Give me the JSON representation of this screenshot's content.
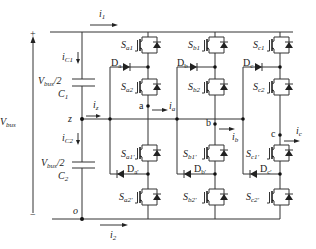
{
  "diagram": {
    "type": "three-level NPC-type inverter schematic",
    "stroke_color": "#333333",
    "source": {
      "label": "V",
      "label_sub": "bus",
      "plus_sign": "+",
      "minus_sign": "−"
    },
    "capacitors": [
      {
        "id": "C1",
        "name": "C",
        "name_sub": "1",
        "voltage": "V",
        "voltage_sub": "bus",
        "voltage_suffix": "/2",
        "current": "i",
        "current_sub": "C1"
      },
      {
        "id": "C2",
        "name": "C",
        "name_sub": "2",
        "voltage": "V",
        "voltage_sub": "bus",
        "voltage_suffix": "/2",
        "current": "i",
        "current_sub": "C2"
      }
    ],
    "nodes": {
      "z": "z",
      "o": "o",
      "a": "a",
      "b": "b",
      "c": "c"
    },
    "currents": {
      "i1": {
        "sym": "i",
        "sub": "1"
      },
      "iz": {
        "sym": "i",
        "sub": "z"
      },
      "i2": {
        "sym": "i",
        "sub": "2"
      },
      "ia": {
        "sym": "i",
        "sub": "a"
      },
      "ib": {
        "sym": "i",
        "sub": "b"
      },
      "ic": {
        "sym": "i",
        "sub": "c"
      }
    },
    "switches": {
      "upper": [
        {
          "phase": "a",
          "s1": {
            "sym": "S",
            "sub": "a1"
          },
          "s2": {
            "sym": "S",
            "sub": "a2"
          },
          "diode": {
            "sym": "D",
            "sub": "a"
          }
        },
        {
          "phase": "b",
          "s1": {
            "sym": "S",
            "sub": "b1"
          },
          "s2": {
            "sym": "S",
            "sub": "b2"
          },
          "diode": {
            "sym": "D",
            "sub": "b"
          }
        },
        {
          "phase": "c",
          "s1": {
            "sym": "S",
            "sub": "c1"
          },
          "s2": {
            "sym": "S",
            "sub": "c2"
          },
          "diode": {
            "sym": "D",
            "sub": "c"
          }
        }
      ],
      "lower": [
        {
          "phase": "a",
          "s1": {
            "sym": "S",
            "sub": "a1'"
          },
          "s2": {
            "sym": "S",
            "sub": "a2'"
          },
          "diode": {
            "sym": "D",
            "sub": "a'"
          }
        },
        {
          "phase": "b",
          "s1": {
            "sym": "S",
            "sub": "b1'"
          },
          "s2": {
            "sym": "S",
            "sub": "b2'"
          },
          "diode": {
            "sym": "D",
            "sub": "b'"
          }
        },
        {
          "phase": "c",
          "s1": {
            "sym": "S",
            "sub": "c1'"
          },
          "s2": {
            "sym": "S",
            "sub": "c2'"
          },
          "diode": {
            "sym": "D",
            "sub": "c'"
          }
        }
      ]
    }
  }
}
